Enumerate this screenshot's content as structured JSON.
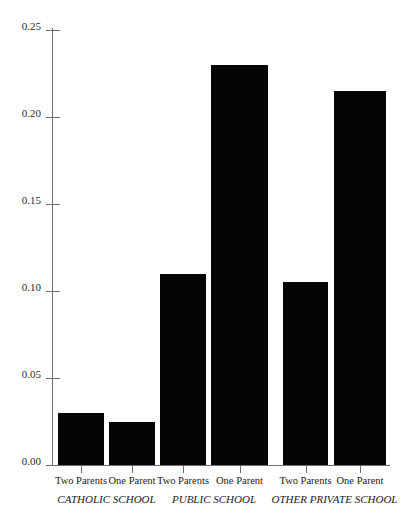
{
  "chart_data": {
    "type": "bar",
    "title": "",
    "subtitle": "",
    "xlabel": "",
    "ylabel": "",
    "ylim": [
      0.0,
      0.25
    ],
    "ytick_labels": [
      "0.00",
      "0.05",
      "0.10",
      "0.15",
      "0.20",
      "0.25"
    ],
    "ytick_values": [
      0.0,
      0.05,
      0.1,
      0.15,
      0.2,
      0.25
    ],
    "grid": false,
    "legend": "none",
    "bar_color": "#050505",
    "axis_color": "#6e6e6e",
    "categories": [
      "Two Parents",
      "One Parent",
      "Two Parents",
      "One Parent",
      "Two Parents",
      "One Parent"
    ],
    "values": [
      0.03,
      0.025,
      0.11,
      0.23,
      0.105,
      0.215
    ],
    "groups": [
      {
        "label": "CATHOLIC SCHOOL",
        "categories": [
          "Two Parents",
          "One Parent"
        ],
        "values": [
          0.03,
          0.025
        ]
      },
      {
        "label": "PUBLIC SCHOOL",
        "categories": [
          "Two Parents",
          "One Parent"
        ],
        "values": [
          0.11,
          0.23
        ]
      },
      {
        "label": "OTHER PRIVATE SCHOOL",
        "categories": [
          "Two Parents",
          "One Parent"
        ],
        "values": [
          0.105,
          0.215
        ]
      }
    ],
    "bars": [
      {
        "label": "Two Parents",
        "group": "CATHOLIC SCHOOL",
        "value": 0.03
      },
      {
        "label": "One Parent",
        "group": "CATHOLIC SCHOOL",
        "value": 0.025
      },
      {
        "label": "Two Parents",
        "group": "PUBLIC SCHOOL",
        "value": 0.11
      },
      {
        "label": "One Parent",
        "group": "PUBLIC SCHOOL",
        "value": 0.23
      },
      {
        "label": "Two Parents",
        "group": "OTHER PRIVATE SCHOOL",
        "value": 0.105
      },
      {
        "label": "One Parent",
        "group": "OTHER PRIVATE SCHOOL",
        "value": 0.215
      }
    ]
  }
}
